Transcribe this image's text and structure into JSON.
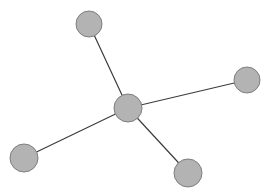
{
  "diagram": {
    "type": "star-graph",
    "width": 276,
    "height": 196,
    "colors": {
      "background": "#ffffff",
      "node_fill": "#b3b3b3",
      "node_stroke": "#7e7e7e",
      "edge": "#3c3c3c"
    },
    "nodes": [
      {
        "id": "center",
        "x": 128,
        "y": 108,
        "r": 14
      },
      {
        "id": "top",
        "x": 89,
        "y": 24,
        "r": 13
      },
      {
        "id": "right",
        "x": 247,
        "y": 80,
        "r": 13
      },
      {
        "id": "left",
        "x": 24,
        "y": 158,
        "r": 14
      },
      {
        "id": "bottom",
        "x": 188,
        "y": 173,
        "r": 14
      }
    ],
    "edges": [
      {
        "from": "center",
        "to": "top"
      },
      {
        "from": "center",
        "to": "right"
      },
      {
        "from": "center",
        "to": "left"
      },
      {
        "from": "center",
        "to": "bottom"
      }
    ]
  }
}
